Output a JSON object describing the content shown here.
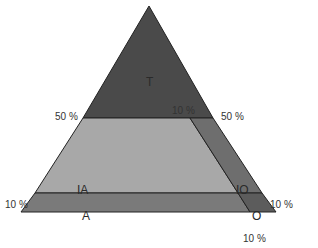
{
  "diagram": {
    "type": "ternary-triangle",
    "regions": [
      {
        "id": "T",
        "label": "T",
        "color": "#4a4a4a"
      },
      {
        "id": "IA",
        "label": "IA",
        "color": "#a8a8a8"
      },
      {
        "id": "IO",
        "label": "IO",
        "color": "#6e6e6e"
      },
      {
        "id": "A",
        "label": "A",
        "color": "#7a7a7a"
      },
      {
        "id": "O",
        "label": "O",
        "color": "#5c5c5c"
      }
    ],
    "labels": {
      "left_50": "50 %",
      "right_50": "50 %",
      "inner_10": "10 %",
      "left_10": "10 %",
      "right_10": "10 %",
      "bottom_10": "10 %"
    }
  }
}
